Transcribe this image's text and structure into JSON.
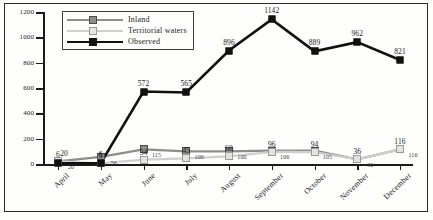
{
  "chart_data": {
    "type": "line",
    "title": "",
    "xlabel": "",
    "ylabel": "",
    "ylim": [
      0,
      1200
    ],
    "yticks": [
      0,
      200,
      400,
      600,
      800,
      1000,
      1200
    ],
    "grid": false,
    "legend_position": "top-left",
    "categories": [
      "April",
      "May",
      "June",
      "July",
      "August",
      "September",
      "October",
      "November",
      "December"
    ],
    "series": [
      {
        "name": "Inland",
        "color": "#8d8d8d",
        "values": [
          20,
          56,
          115,
          100,
          100,
          106,
          105,
          36,
          116
        ]
      },
      {
        "name": "Territorial waters",
        "color": "#e2e2e2",
        "values": [
          20,
          6,
          34,
          45,
          60,
          96,
          94,
          36,
          116
        ]
      },
      {
        "name": "Observed",
        "color": "#111111",
        "values": [
          6,
          6,
          572,
          565,
          896,
          1142,
          889,
          962,
          821
        ]
      }
    ]
  },
  "legend": {
    "items": [
      {
        "label": "Inland"
      },
      {
        "label": "Territorial waters"
      },
      {
        "label": "Observed"
      }
    ]
  },
  "axis": {
    "y_tick_labels": [
      "1200",
      "1000",
      "800",
      "600",
      "400",
      "200",
      "0"
    ],
    "x_tick_labels": [
      "April",
      "May",
      "June",
      "July",
      "August",
      "September",
      "October",
      "November",
      "December"
    ]
  },
  "point_labels": {
    "observed": [
      "6",
      "6",
      "572",
      "565",
      "896",
      "1142",
      "889",
      "962",
      "821"
    ],
    "territorial": [
      "20",
      "6",
      "34",
      "45",
      "60",
      "96",
      "94",
      "36",
      "116"
    ],
    "inland": [
      "20",
      "56",
      "115",
      "100",
      "100",
      "106",
      "105",
      "36",
      "116"
    ]
  }
}
